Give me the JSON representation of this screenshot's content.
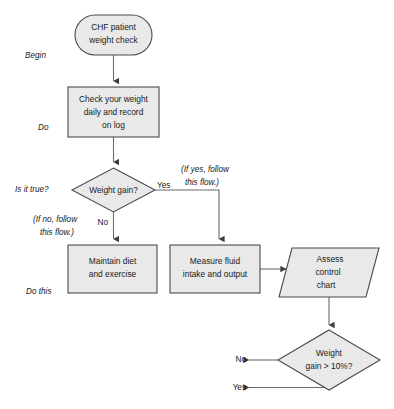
{
  "diagram": {
    "colors": {
      "shape_fill": "#e9e9e9",
      "shape_stroke": "#4a4a4a",
      "edge_stroke": "#6b6b6b",
      "text": "#1a1a1a",
      "background": "#ffffff"
    },
    "nodes": [
      {
        "id": "start",
        "shape": "stadium",
        "lines": [
          "CHF patient",
          "weight check"
        ]
      },
      {
        "id": "check_weight",
        "shape": "rectangle",
        "lines": [
          "Check your weight",
          "daily and record",
          "on log"
        ]
      },
      {
        "id": "weight_gain",
        "shape": "diamond",
        "lines": [
          "Weight gain?"
        ]
      },
      {
        "id": "maintain",
        "shape": "rectangle",
        "lines": [
          "Maintain diet",
          "and exercise"
        ]
      },
      {
        "id": "measure_fluid",
        "shape": "rectangle",
        "lines": [
          "Measure fluid",
          "intake and output"
        ]
      },
      {
        "id": "assess_chart",
        "shape": "parallelogram",
        "lines": [
          "Assess",
          "control",
          "chart"
        ]
      },
      {
        "id": "weight_gain_pct",
        "shape": "diamond",
        "lines": [
          "Weight",
          "gain > 10%?"
        ]
      }
    ],
    "swimlane_labels": [
      {
        "id": "begin",
        "text": "Begin"
      },
      {
        "id": "do",
        "text": "Do"
      },
      {
        "id": "is_it_true",
        "text": "Is it true?"
      },
      {
        "id": "do_this",
        "text": "Do this"
      }
    ],
    "edge_labels": [
      {
        "id": "yes_top",
        "text": "Yes"
      },
      {
        "id": "no_top",
        "text": "No"
      },
      {
        "id": "no_bottom",
        "text": "No"
      },
      {
        "id": "yes_bottom",
        "text": "Yes"
      }
    ],
    "annotations": [
      {
        "id": "if_yes",
        "lines": [
          "(If yes, follow",
          "this flow.)"
        ]
      },
      {
        "id": "if_no",
        "lines": [
          "(If no, follow",
          "this flow.)"
        ]
      }
    ]
  }
}
